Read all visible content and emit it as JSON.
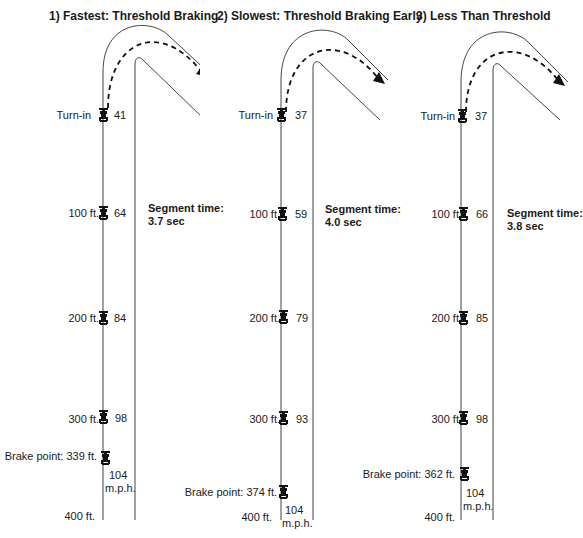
{
  "colors": {
    "ink": "#1a1a1a",
    "track": "#555555",
    "background": "#ffffff"
  },
  "panels": [
    {
      "title": "1) Fastest: Threshold Braking",
      "segment_time_label": "Segment time:",
      "segment_time": "3.7 sec",
      "markers": [
        {
          "label": "Turn-in",
          "speed": "41"
        },
        {
          "label": "100 ft.",
          "speed": "64"
        },
        {
          "label": "200 ft.",
          "speed": "84"
        },
        {
          "label": "300 ft.",
          "speed": "98"
        }
      ],
      "brake_point": {
        "label": "Brake point: 339 ft.",
        "speed": "104",
        "unit": "m.p.h."
      },
      "end_label": "400 ft."
    },
    {
      "title": "2) Slowest: Threshold Braking Early",
      "segment_time_label": "Segment time:",
      "segment_time": "4.0 sec",
      "markers": [
        {
          "label": "Turn-in",
          "speed": "37"
        },
        {
          "label": "100 ft.",
          "speed": "59"
        },
        {
          "label": "200 ft.",
          "speed": "79"
        },
        {
          "label": "300 ft.",
          "speed": "93"
        }
      ],
      "brake_point": {
        "label": "Brake point: 374 ft.",
        "speed": "104",
        "unit": "m.p.h."
      },
      "end_label": "400 ft."
    },
    {
      "title": "3) Less Than Threshold",
      "segment_time_label": "Segment time:",
      "segment_time": "3.8 sec",
      "markers": [
        {
          "label": "Turn-in",
          "speed": "37"
        },
        {
          "label": "100 ft.",
          "speed": "66"
        },
        {
          "label": "200 ft.",
          "speed": "85"
        },
        {
          "label": "300 ft.",
          "speed": "98"
        }
      ],
      "brake_point": {
        "label": "Brake point: 362 ft.",
        "speed": "104",
        "unit": "m.p.h."
      },
      "end_label": "400 ft."
    }
  ]
}
